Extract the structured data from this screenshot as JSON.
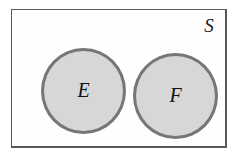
{
  "diagram": {
    "type": "venn-diagram",
    "universe": {
      "label": "S",
      "shape": "rectangle",
      "fill_color": "#fefefe",
      "border_color": "#595959"
    },
    "sets": [
      {
        "id": "E",
        "label": "E",
        "shape": "circle",
        "fill_color": "#d7d7d7",
        "border_color": "#767676"
      },
      {
        "id": "F",
        "label": "F",
        "shape": "circle",
        "fill_color": "#d7d7d7",
        "border_color": "#767676"
      }
    ],
    "background_color": "#ffffff"
  }
}
